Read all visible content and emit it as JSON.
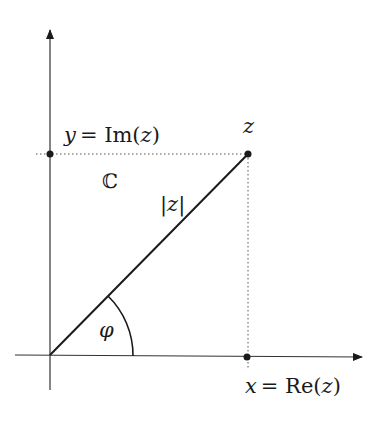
{
  "diagram": {
    "colors": {
      "background": "#ffffff",
      "stroke": "#1a1a1a",
      "dotted": "#555555"
    },
    "origin": {
      "x": 50,
      "y": 355
    },
    "point_z": {
      "x": 248,
      "y": 154
    },
    "labels": {
      "z": "z",
      "im_y": "y",
      "im_eq": "= Im(",
      "im_z": "z",
      "im_close": ")",
      "re_x": "x",
      "re_eq": "= Re(",
      "re_z": "z",
      "re_close": ")",
      "plane": "ℂ",
      "modulus": "|z|",
      "angle": "φ"
    }
  }
}
